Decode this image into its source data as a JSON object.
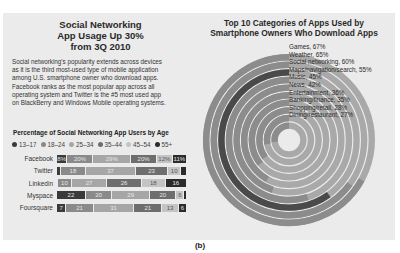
{
  "left_panel": {
    "title_lines": [
      "Social Networking",
      "App Usage Up 30%",
      "from 3Q 2010"
    ],
    "body_lines": [
      "Social networking's popularity extends across devices",
      "as it is the third most-used type of mobile application",
      "among U.S. smartphone owner who download apps.",
      "Facebook ranks as the most popular app across all",
      "operating system and Twitter is the #5 most used app",
      "on BlackBerry and Windows Mobile operating systems."
    ],
    "chart_title": "Percentage of Social Networking App Users by Age"
  },
  "right_panel": {
    "title_lines": [
      "Top 10 Categories of Apps Used by",
      "Smartphone Owners Who Download Apps"
    ]
  },
  "caption": "(b)",
  "chart_data": [
    {
      "type": "bar",
      "orientation": "horizontal-stacked",
      "title": "Percentage of Social Networking App Users by Age",
      "categories": [
        "Facebook",
        "Twitter",
        "Linkedin",
        "Myspace",
        "Foursquare"
      ],
      "legend": [
        "13–17",
        "18–24",
        "25–34",
        "35–44",
        "45–54",
        "55+"
      ],
      "colors": [
        "#3a3a3a",
        "#8a8a8a",
        "#a6a6a6",
        "#6e6e6e",
        "#c4c4c4",
        "#2b2b2b"
      ],
      "series": [
        {
          "name": "13–17",
          "values": [
            8,
            3,
            1,
            22,
            7
          ]
        },
        {
          "name": "18–24",
          "values": [
            20,
            18,
            10,
            20,
            21
          ]
        },
        {
          "name": "25–34",
          "values": [
            29,
            37,
            27,
            29,
            31
          ]
        },
        {
          "name": "35–44",
          "values": [
            20,
            23,
            26,
            20,
            21
          ]
        },
        {
          "name": "45–54",
          "values": [
            12,
            10,
            18,
            6,
            13
          ]
        },
        {
          "name": "55+",
          "values": [
            11,
            4,
            16,
            2,
            6
          ]
        }
      ],
      "data_labels": [
        [
          "8%",
          "20%",
          "29%",
          "20%",
          "12%",
          "11%"
        ],
        [
          "3",
          "18",
          "37",
          "23",
          "10",
          "4"
        ],
        [
          "1",
          "10",
          "27",
          "26",
          "18",
          "16"
        ],
        [
          "22",
          "20",
          "29",
          "20",
          "6",
          "2"
        ],
        [
          "7",
          "21",
          "31",
          "21",
          "13",
          "6"
        ]
      ],
      "xlim": [
        0,
        100
      ]
    },
    {
      "type": "radial-bar",
      "title": "Top 10 Categories of Apps Used by Smartphone Owners Who Download Apps",
      "categories": [
        "Games",
        "Weather",
        "Social networking",
        "Maps/navigation/search",
        "Music",
        "News",
        "Entertainment",
        "Banking/finance",
        "Shopping/retail",
        "Dining/restaurant"
      ],
      "values": [
        67,
        65,
        60,
        55,
        45,
        42,
        36,
        35,
        28,
        27
      ],
      "labels": [
        "Games, 67%",
        "Weather, 65%",
        "Social networking, 60%",
        "Maps/navigation/search, 55%",
        "Music, 45%",
        "News, 42%",
        "Entertainment, 36%",
        "Banking/finance, 35%",
        "Shopping/retail, 28%",
        "Dining/restaurant, 27%"
      ],
      "highlight": "Social networking",
      "unit": "%",
      "max": 100
    }
  ]
}
